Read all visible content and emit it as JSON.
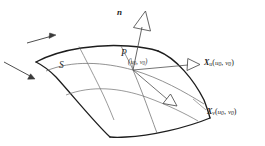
{
  "figure": {
    "caption_present": false,
    "background_color": "#ffffff",
    "ink_color": "#2b2b2b",
    "grid_color": "#7a7a7a",
    "boundary_color": "#1d1d1d",
    "labels": {
      "normal_vector": "n",
      "surface": "S",
      "point": "P",
      "point_parameters": "(u0, v0)",
      "tangent_u": "Xu(u0, v0)",
      "tangent_v": "Xv(u0, v0)"
    },
    "label_parts": {
      "param_open": "(",
      "param_u": "u",
      "param_sub": "0",
      "param_comma": ", ",
      "param_v": "v",
      "param_close": ")",
      "x_symbol": "X",
      "sub_u": "u",
      "sub_v": "v"
    },
    "elements": {
      "normal_arrow_name": "normal-vector-arrow",
      "tangent_u_arrow_name": "tangent-u-arrow",
      "tangent_v_arrow_name": "tangent-v-arrow",
      "motion_arrow_top": "direction-arrow-top",
      "motion_arrow_bottom": "direction-arrow-bottom",
      "surface_patch": "surface-patch"
    },
    "geometry": {
      "point_p_x": 133,
      "point_p_y": 70,
      "normal_tip_x": 145,
      "normal_tip_y": 20,
      "tangent_u_tip_x": 199,
      "tangent_u_tip_y": 64,
      "tangent_v_tip_x": 176,
      "tangent_v_tip_y": 104,
      "corner_left_x": 36,
      "corner_left_y": 62,
      "corner_top_x": 158,
      "corner_top_y": 51,
      "corner_right_x": 210,
      "corner_right_y": 118,
      "corner_bottom_x": 110,
      "corner_bottom_y": 137
    }
  }
}
